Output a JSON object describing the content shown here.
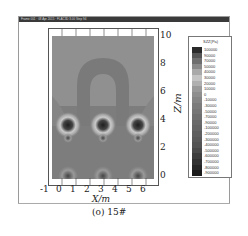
{
  "window": {
    "title": "Frame 001 · 08 Apr 2015 · FLAC3D 3.00 Step 94"
  },
  "caption": "(o) 15#",
  "chart_data": {
    "type": "heatmap",
    "title": "",
    "xlabel": "X/m",
    "ylabel": "Z/m",
    "xlim": [
      -1,
      6.3
    ],
    "ylim": [
      0,
      10.3
    ],
    "x_ticks": [
      "-1",
      "0",
      "1",
      "2",
      "3",
      "4",
      "5",
      "6"
    ],
    "y_ticks": [
      "0",
      "2",
      "4",
      "6",
      "8",
      "10"
    ],
    "grid": false,
    "legend_position": "right",
    "legend_title": "SZZ(Pa)",
    "legend_levels": [
      "100000",
      "90000",
      "70000",
      "50000",
      "40000",
      "30000",
      "20000",
      "10000",
      "0",
      "-10000",
      "-30000",
      "-50000",
      "-70000",
      "-90000",
      "-100000",
      "-200000",
      "-300000",
      "-400000",
      "-500000",
      "-600000",
      "-700000",
      "-800000",
      "-900000"
    ],
    "legend_colors": [
      "#2a2a2a",
      "#555555",
      "#6f6f6f",
      "#8a8a8a",
      "#a9a9a9",
      "#c4c4c4",
      "#b0b0b0",
      "#9a9a9a",
      "#8e8e8e",
      "#858585",
      "#7c7c7c",
      "#777777",
      "#707070",
      "#6a6a6a",
      "#656565",
      "#5f5f5f",
      "#5a5a5a",
      "#545454",
      "#4a4a4a",
      "#3d3d3d",
      "#323232",
      "#262626",
      "#1a1a1a"
    ],
    "features": [
      {
        "type": "arch",
        "description": "inverted-U stress band between x≈0.5 and x≈4.5, top at z≈7.5"
      },
      {
        "type": "concentration",
        "x": 0.3,
        "z": 3.8
      },
      {
        "type": "concentration",
        "x": 2.6,
        "z": 3.8
      },
      {
        "type": "concentration",
        "x": 5.0,
        "z": 3.8
      },
      {
        "type": "concentration",
        "x": 0.3,
        "z": 0.3
      },
      {
        "type": "concentration",
        "x": 2.6,
        "z": 0.3
      },
      {
        "type": "concentration",
        "x": 5.0,
        "z": 0.3
      }
    ]
  }
}
